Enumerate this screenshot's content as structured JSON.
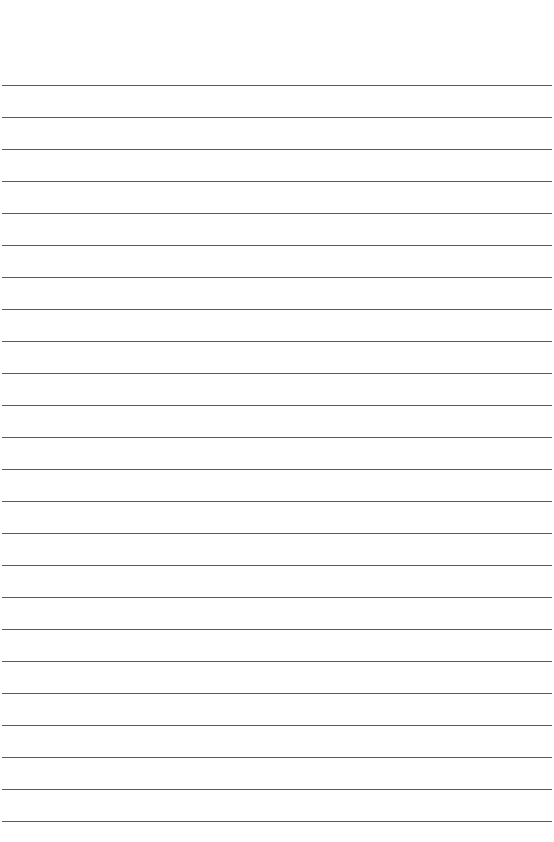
{
  "page": {
    "type": "lined-paper",
    "background": "#ffffff",
    "line_color": "#5a5a5a",
    "first_line_y": 85,
    "line_spacing": 32,
    "line_count": 24
  }
}
